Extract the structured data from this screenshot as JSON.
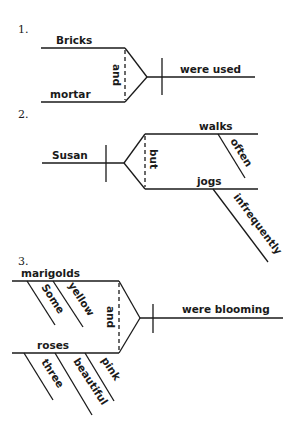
{
  "diagrams": [
    {
      "number": "1.",
      "subjects": [
        "Bricks",
        "mortar"
      ],
      "conjunction": "and",
      "predicate": "were used"
    },
    {
      "number": "2.",
      "subject": "Susan",
      "conjunction": "but",
      "predicates": [
        "walks",
        "jogs"
      ],
      "modifiers": [
        "often",
        "infrequently"
      ]
    },
    {
      "number": "3.",
      "subjects": [
        "marigolds",
        "roses"
      ],
      "subject1_modifiers": [
        "Some",
        "yellow"
      ],
      "subject2_modifiers": [
        "three",
        "beautiful",
        "pink"
      ],
      "conjunction": "and",
      "predicate": "were blooming"
    }
  ]
}
